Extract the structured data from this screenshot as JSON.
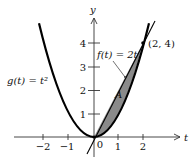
{
  "figure": {
    "axes": {
      "x_label": "t",
      "y_label": "y",
      "x_ticks": [
        {
          "value": -2,
          "label": "−2"
        },
        {
          "value": -1,
          "label": "−1"
        },
        {
          "value": 0,
          "label": "0"
        },
        {
          "value": 1,
          "label": "1"
        },
        {
          "value": 2,
          "label": "2"
        }
      ],
      "y_ticks": [
        {
          "value": 1,
          "label": "1"
        },
        {
          "value": 2,
          "label": "2"
        },
        {
          "value": 3,
          "label": "3"
        },
        {
          "value": 4,
          "label": "4"
        }
      ]
    },
    "curves": {
      "parabola_label": "g(t) = t²",
      "line_label": "f(t) = 2t"
    },
    "region_label": "A",
    "point_label": "(2, 4)",
    "colors": {
      "curve": "#000000",
      "region_fill": "#8a8a8a",
      "axis": "#333333"
    }
  }
}
